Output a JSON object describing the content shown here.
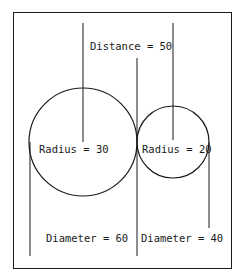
{
  "diagram": {
    "distance_label": "Distance = 50",
    "circles": [
      {
        "name": "large",
        "radius_label": "Radius = 30",
        "diameter_label": "Diameter = 60",
        "radius": 30,
        "diameter": 60
      },
      {
        "name": "small",
        "radius_label": "Radius = 20",
        "diameter_label": "Diameter = 40",
        "radius": 20,
        "diameter": 40
      }
    ],
    "distance": 50,
    "stroke_color": "#1a1a1a",
    "background": "#ffffff"
  }
}
